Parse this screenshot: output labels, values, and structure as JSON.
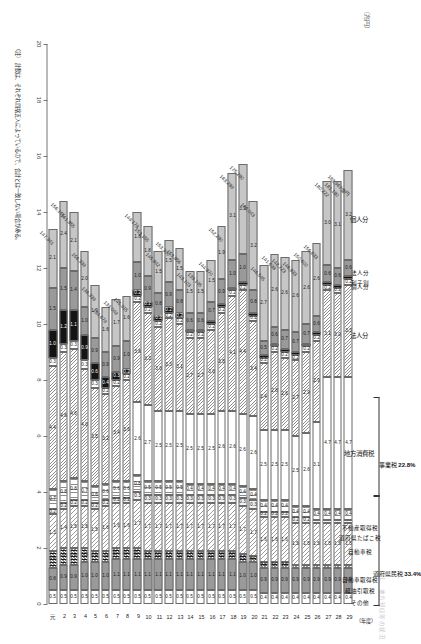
{
  "meta": {
    "faint_header": "１　地方税収等の状況",
    "axis_unit": "（兆円）",
    "year_axis_unit": "（年度）",
    "note": "（注）　計数は、それぞれ四捨五入によっているので、合計とは一致しない場合がある。"
  },
  "categories": [
    {
      "key": "kojin_jumin",
      "label": "個人分",
      "group": "juminzei",
      "fill": "f-solidgrey"
    },
    {
      "key": "hojin_jumin",
      "label": "法人分",
      "group": "juminzei",
      "fill": "f-grey"
    },
    {
      "key": "rishiwari",
      "label": "利子割",
      "group": "juminzei",
      "fill": "f-black"
    },
    {
      "key": "kojin_jigyo",
      "label": "個人分",
      "group": "jigyozei",
      "fill": "f-white"
    },
    {
      "key": "hojin_jigyo",
      "label": "法人分",
      "group": "jigyozei",
      "fill": "f-hatch"
    },
    {
      "key": "chiho_shohi",
      "label": "地方消費税",
      "group": "-",
      "fill": "f-white"
    },
    {
      "key": "fudosan",
      "label": "不動産取得税",
      "group": "-",
      "fill": "f-vstripe"
    },
    {
      "key": "tobacco",
      "label": "道府県たばこ税",
      "group": "-",
      "fill": "f-light"
    },
    {
      "key": "jidosha",
      "label": "自動車税",
      "group": "-",
      "fill": "f-hatch2"
    },
    {
      "key": "jidosha_shutoku",
      "label": "自動車取得税",
      "group": "-",
      "fill": "f-check"
    },
    {
      "key": "keiyu",
      "label": "軽油引取税",
      "group": "-",
      "fill": "f-grey"
    },
    {
      "key": "sonota",
      "label": "その他",
      "group": "-",
      "fill": "f-white"
    }
  ],
  "brackets": [
    {
      "label": "道府県民税",
      "pct": "33.4%",
      "members": [
        "個人分",
        "法人分",
        "利子割"
      ]
    },
    {
      "label": "事業税",
      "pct": "22.8%",
      "members": [
        "個人分",
        "法人分"
      ]
    }
  ],
  "chart_data": {
    "type": "bar",
    "orientation": "horizontal-stacked",
    "title": "地方税収等の状況",
    "xlabel": "（兆円）",
    "ylabel": "（年度）",
    "xlim": [
      0,
      20
    ],
    "xticks": [
      0,
      2,
      4,
      6,
      8,
      10,
      12,
      14,
      16,
      18,
      20
    ],
    "grid": false,
    "legend_position": "top",
    "categories": [
      "元",
      "2",
      "3",
      "4",
      "5",
      "6",
      "7",
      "8",
      "9",
      "10",
      "11",
      "12",
      "13",
      "14",
      "15",
      "16",
      "17",
      "18",
      "19",
      "20",
      "21",
      "22",
      "23",
      "24",
      "25",
      "26",
      "27",
      "28",
      "29"
    ],
    "series": [
      {
        "name": "個人分（道府県民税）",
        "fill": "f-solidgrey",
        "values": [
          2.1,
          2.4,
          2.1,
          2.0,
          1.9,
          1.6,
          1.7,
          1.6,
          1.8,
          1.8,
          1.5,
          1.5,
          1.5,
          1.5,
          1.5,
          1.5,
          1.9,
          3.1,
          3.2,
          3.2,
          2.7,
          2.6,
          2.6,
          2.6,
          2.6,
          2.6,
          3.0,
          3.1,
          3.2
        ]
      },
      {
        "name": "法人分（道府県民税）",
        "fill": "f-grey",
        "values": [
          1.5,
          1.5,
          1.4,
          1.0,
          0.9,
          0.9,
          0.9,
          1.0,
          1.0,
          0.9,
          0.8,
          0.9,
          0.8,
          0.6,
          0.6,
          0.7,
          0.9,
          1.0,
          1.0,
          0.8,
          0.5,
          0.6,
          0.7,
          0.7,
          0.7,
          0.6,
          0.6,
          0.6,
          0.6
        ]
      },
      {
        "name": "利子割",
        "fill": "f-black",
        "values": [
          1.0,
          1.2,
          1.1,
          0.9,
          0.6,
          0.4,
          0.3,
          0.2,
          0.2,
          0.2,
          0.2,
          0.2,
          0.2,
          0.1,
          0.1,
          0.1,
          0.1,
          0.1,
          0.1,
          0.1,
          0.1,
          0.1,
          0.1,
          0.1,
          0.1,
          0.1,
          0.1,
          0.1,
          0.1
        ]
      },
      {
        "name": "個人分（事業税）",
        "fill": "f-white",
        "values": [
          0.3,
          0.3,
          0.3,
          0.3,
          0.3,
          0.2,
          0.2,
          0.2,
          0.2,
          0.2,
          0.2,
          0.2,
          0.2,
          0.2,
          0.2,
          0.2,
          0.2,
          0.2,
          0.2,
          0.2,
          0.2,
          0.2,
          0.2,
          0.2,
          0.2,
          0.2,
          0.2,
          0.2,
          0.2
        ]
      },
      {
        "name": "法人分（事業税）",
        "fill": "f-hatch",
        "values": [
          4.4,
          4.6,
          4.6,
          4.0,
          3.5,
          3.2,
          3.4,
          3.6,
          3.6,
          3.3,
          3.0,
          3.3,
          3.1,
          2.7,
          2.7,
          3.0,
          3.5,
          4.1,
          4.4,
          3.4,
          2.4,
          2.8,
          2.6,
          2.7,
          2.9,
          2.9,
          3.1,
          3.0,
          3.3
        ]
      },
      {
        "name": "地方消費税",
        "fill": "f-white",
        "values": [
          0,
          0,
          0,
          0,
          0,
          0,
          0,
          0,
          2.6,
          2.7,
          2.5,
          2.5,
          2.5,
          2.5,
          2.5,
          2.5,
          2.6,
          2.6,
          2.6,
          2.6,
          2.5,
          2.5,
          2.5,
          2.5,
          2.6,
          3.1,
          4.7,
          4.7,
          4.7
        ]
      },
      {
        "name": "不動産取得税",
        "fill": "f-vstripe",
        "values": [
          0.7,
          0.8,
          0.8,
          0.7,
          0.6,
          0.6,
          0.6,
          0.6,
          0.6,
          0.5,
          0.5,
          0.5,
          0.5,
          0.4,
          0.4,
          0.4,
          0.4,
          0.4,
          0.4,
          0.4,
          0.4,
          0.4,
          0.4,
          0.4,
          0.4,
          0.4,
          0.4,
          0.4,
          0.4
        ]
      },
      {
        "name": "道府県たばこ税",
        "fill": "f-light",
        "values": [
          0.2,
          0.2,
          0.2,
          0.2,
          0.2,
          0.2,
          0.2,
          0.2,
          0.3,
          0.3,
          0.3,
          0.3,
          0.3,
          0.3,
          0.3,
          0.3,
          0.3,
          0.3,
          0.3,
          0.3,
          0.2,
          0.2,
          0.2,
          0.2,
          0.2,
          0.1,
          0.1,
          0.1,
          0.1
        ]
      },
      {
        "name": "自動車税",
        "fill": "f-hatch2",
        "values": [
          1.3,
          1.4,
          1.5,
          1.5,
          1.5,
          1.6,
          1.6,
          1.6,
          1.7,
          1.7,
          1.7,
          1.7,
          1.7,
          1.7,
          1.7,
          1.7,
          1.7,
          1.7,
          1.7,
          1.7,
          1.6,
          1.6,
          1.6,
          1.5,
          1.5,
          1.5,
          1.5,
          1.5,
          1.5
        ]
      },
      {
        "name": "自動車取得税",
        "fill": "f-check",
        "values": [
          0.6,
          0.6,
          0.6,
          0.5,
          0.4,
          0.4,
          0.4,
          0.4,
          0.4,
          0.3,
          0.3,
          0.3,
          0.3,
          0.3,
          0.3,
          0.3,
          0.3,
          0.3,
          0.3,
          0.2,
          0.2,
          0.2,
          0.2,
          0.1,
          0.1,
          0.1,
          0.1,
          0.1,
          0.1
        ]
      },
      {
        "name": "軽油引取税",
        "fill": "f-grey",
        "values": [
          0.8,
          0.9,
          0.9,
          1.0,
          1.0,
          1.0,
          1.1,
          1.1,
          1.1,
          1.1,
          1.1,
          1.1,
          1.1,
          1.1,
          1.1,
          1.1,
          1.1,
          1.1,
          1.0,
          1.0,
          0.9,
          0.9,
          0.9,
          0.9,
          0.9,
          0.9,
          0.9,
          0.9,
          0.9
        ]
      },
      {
        "name": "その他",
        "fill": "f-white",
        "values": [
          0.5,
          0.5,
          0.5,
          0.5,
          0.5,
          0.5,
          0.5,
          0.5,
          0.5,
          0.5,
          0.5,
          0.5,
          0.5,
          0.5,
          0.5,
          0.5,
          0.5,
          0.5,
          0.5,
          0.5,
          0.4,
          0.4,
          0.4,
          0.4,
          0.4,
          0.4,
          0.4,
          0.4,
          0.4
        ]
      }
    ],
    "totals": [
      {
        "year": "元",
        "value": "147,341"
      },
      {
        "year": "2",
        "value": "156,165"
      },
      {
        "year": "3",
        "value": "161,855"
      },
      {
        "year": "4",
        "value": "156,339"
      },
      {
        "year": "5",
        "value": "136,339"
      },
      {
        "year": "6",
        "value": "134,679"
      },
      {
        "year": "7",
        "value": "139,049"
      },
      {
        "year": "8",
        "value": "145,915"
      },
      {
        "year": "9",
        "value": "149,178"
      },
      {
        "year": "10",
        "value": "153,155"
      },
      {
        "year": "11",
        "value": "145,842"
      },
      {
        "year": "12",
        "value": "153,300"
      },
      {
        "year": "13",
        "value": "153,856"
      },
      {
        "year": "14",
        "value": "143,103"
      },
      {
        "year": "15",
        "value": "139,195"
      },
      {
        "year": "16",
        "value": "144,870"
      },
      {
        "year": "17",
        "value": "152,280"
      },
      {
        "year": "18",
        "value": "163,289"
      },
      {
        "year": "19",
        "value": "175,280"
      },
      {
        "year": "20",
        "value": "166,043"
      },
      {
        "year": "21",
        "value": "146,545"
      },
      {
        "year": "22",
        "value": "141,638"
      },
      {
        "year": "23",
        "value": "142,723"
      },
      {
        "year": "24",
        "value": "146,833"
      },
      {
        "year": "25",
        "value": "150,600"
      },
      {
        "year": "26",
        "value": "156,633"
      },
      {
        "year": "27",
        "value": "180,222"
      },
      {
        "year": "28",
        "value": "181,180"
      },
      {
        "year": "29",
        "value": "183,967億円"
      }
    ]
  }
}
